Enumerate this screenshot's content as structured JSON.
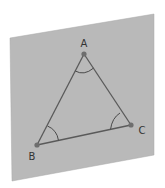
{
  "diagram": {
    "plane": {
      "corners": [
        [
          10,
          38
        ],
        [
          154,
          14
        ],
        [
          154,
          155
        ],
        [
          12,
          181
        ]
      ],
      "fill": "#b9b9b9",
      "edge": "#a8a8a8"
    },
    "points": [
      {
        "id": "A",
        "label": "A",
        "x": 84,
        "y": 54,
        "label_x": 84,
        "label_y": 44
      },
      {
        "id": "B",
        "label": "B",
        "x": 37,
        "y": 145,
        "label_x": 32,
        "label_y": 157
      },
      {
        "id": "C",
        "label": "C",
        "x": 131,
        "y": 125,
        "label_x": 142,
        "label_y": 131
      }
    ],
    "line_color": "#5a5a5a",
    "point_color": "#6e6e6e",
    "angle_arcs": [
      "A",
      "B",
      "C"
    ]
  }
}
